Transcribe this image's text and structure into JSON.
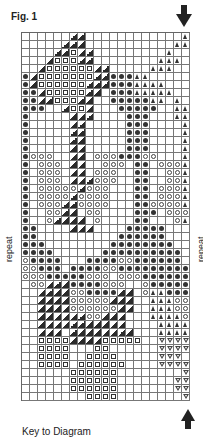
{
  "figure": {
    "title": "Fig. 1",
    "repeat_label_left": "repeat",
    "repeat_label_right": "repeat",
    "key_title": "Key to Diagram"
  },
  "legend_symbols": {
    ".": "empty",
    "o": "filled-dot",
    "c": "hollow-circle",
    "s": "hollow-square",
    "d": "diagonal-half-dark",
    "t": "filled-triangle",
    "v": "hollow-inverted-triangle"
  },
  "grid": {
    "columns": 21,
    "rows": [
      "......dd............t",
      ".....ddd...........tt",
      "....ddsdd.........t..",
      "...dsssdd........ttt.",
      "..dssssssdd.....ttt..",
      "odsssssssddooott.....",
      "odssssssdddoootttt...",
      "oodsssssdd.ooottttt..",
      "ooddsssdd..ooooott.t.",
      "ooo..dssd...ooooo..tt",
      "o.....ddd....ooo...tt",
      "o.....dd.....ooo....t",
      "o.....dd.....ooo....t",
      "o.....dd.....ooo....t",
      "o.....dd.....ooo....t",
      "occc..dd.cccooocc...t",
      "o.ccc.dd..ccc.oo.ccct",
      "o.ccc.dd.ccc..oo..cct",
      "o.ccc.dddccc..oo..cct",
      "o.cccccdccc...oo.ccct",
      "o.ccccdcccc...oo.ccct",
      "o.cccddcccc...oocccct",
      "o..ccdd.cc....ooo.ccct",
      "o..cdddd.c....oo...ctt",
      "oo....ddd....ooooo...t",
      "oo..........oooooo...t",
      "ooo........oooooooo...",
      "oooo......oooooooooo..",
      "coooo...ooooccoooooo..",
      "ccooo.ooooccooooooooo.",
      "cccoooooccc.cccooooooo",
      ".ccdddooooccc..cooooo.",
      "..ddddccoooodd.cttooo.",
      "..ddddcccccddd..tttcco",
      "..ddddccccccdd..tttcco",
      "..ddddddccddd...ttttcc",
      "..ddddddddddd....tttt.",
      "..ddd.dddddddd...tttt.",
      "..ssssddddsssss..vvvvtt",
      "..ssss...ss......vvvvv.",
      "..ssss..ssss.....vvv..v",
      "..ssss.ssssss....vvvv.v",
      "......ssssss........vvv",
      "......ssssss.......vvv.",
      "......ssssss.......vvv.",
      "........ssss........vv."
    ]
  }
}
